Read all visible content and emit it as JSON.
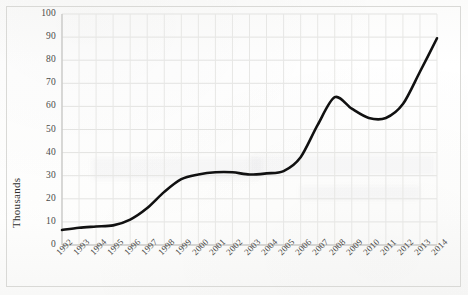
{
  "chart_data": {
    "type": "line",
    "title": "",
    "xlabel": "",
    "ylabel": "Thousands",
    "ylim": [
      0,
      100
    ],
    "ytick_step": 10,
    "yticks": [
      0,
      10,
      20,
      30,
      40,
      50,
      60,
      70,
      80,
      90,
      100
    ],
    "grid": true,
    "legend": "none",
    "line_color": "#111111",
    "categories": [
      "1992",
      "1993",
      "1994",
      "1995",
      "1996",
      "1997",
      "1998",
      "1999",
      "2000",
      "2001",
      "2002",
      "2003",
      "2004",
      "2005",
      "2006",
      "2007",
      "2008",
      "2009",
      "2010",
      "2011",
      "2012",
      "2013",
      "2014"
    ],
    "values": [
      6.5,
      7.5,
      8.0,
      8.5,
      11.0,
      16.0,
      23.0,
      28.5,
      30.5,
      31.5,
      31.5,
      30.5,
      31.0,
      32.0,
      38.0,
      52.0,
      64.0,
      59.0,
      55.0,
      55.0,
      61.0,
      75.0,
      89.5
    ],
    "series": [
      {
        "name": "series-1",
        "values": [
          6.5,
          7.5,
          8.0,
          8.5,
          11.0,
          16.0,
          23.0,
          28.5,
          30.5,
          31.5,
          31.5,
          30.5,
          31.0,
          32.0,
          38.0,
          52.0,
          64.0,
          59.0,
          55.0,
          55.0,
          61.0,
          75.0,
          89.5
        ]
      }
    ]
  },
  "axis": {
    "y_title": "Thousands"
  }
}
